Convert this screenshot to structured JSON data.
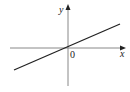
{
  "diagram": {
    "type": "cartesian-line-through-origin",
    "axes": {
      "x_label": "x",
      "y_label": "y",
      "origin_label": "0"
    },
    "line": {
      "description": "straight line with positive slope passing through origin",
      "from": [
        14,
        70
      ],
      "to": [
        120,
        24
      ]
    },
    "colors": {
      "axis": "#888888",
      "line": "#222222",
      "text": "#222222"
    }
  }
}
